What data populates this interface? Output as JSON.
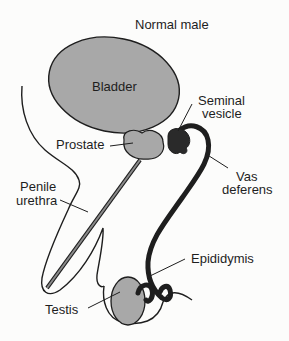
{
  "title": "Normal male",
  "labels": {
    "bladder": "Bladder",
    "seminal_vesicle_1": "Seminal",
    "seminal_vesicle_2": "vesicle",
    "prostate": "Prostate",
    "vas_deferens_1": "Vas",
    "vas_deferens_2": "deferens",
    "penile_urethra_1": "Penile",
    "penile_urethra_2": "urethra",
    "epididymis": "Epididymis",
    "testis": "Testis"
  },
  "colors": {
    "organ_fill": "#a8a8a8",
    "dark_structure": "#2a2a2a",
    "outline": "#1e1e1e",
    "background": "#fcfcfb"
  }
}
